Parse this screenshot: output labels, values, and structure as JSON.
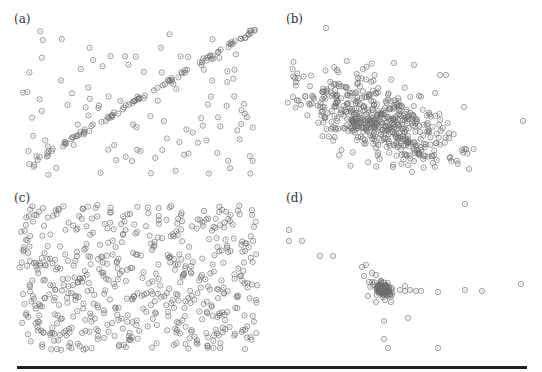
{
  "figure": {
    "marker": {
      "shape": "circle-with-dot",
      "radius": 2.6,
      "stroke": "#6e6e6e",
      "fill": "none",
      "dot": "#6e6e6e"
    },
    "rule_color": "#222222"
  },
  "panels": [
    {
      "label": "(a)",
      "label_pos": [
        14,
        12
      ]
    },
    {
      "label": "(b)",
      "label_pos": [
        286,
        12
      ]
    },
    {
      "label": "(c)",
      "label_pos": [
        14,
        191
      ]
    },
    {
      "label": "(d)",
      "label_pos": [
        286,
        191
      ]
    }
  ],
  "chart_data": [
    {
      "type": "scatter",
      "title": "(a)",
      "description": "Points on a straight diagonal line plus uniform random noise",
      "xlabel": "",
      "ylabel": "",
      "grid": false,
      "axes": false,
      "bbox": [
        17,
        28,
        255,
        175
      ],
      "line_component": {
        "x0": 17,
        "y0": 172,
        "x1": 255,
        "y1": 30,
        "n": 95,
        "jitter": 1.2
      },
      "noise_component": {
        "n": 110,
        "region": [
          17,
          28,
          255,
          175
        ]
      },
      "seed": 11
    },
    {
      "type": "scatter",
      "title": "(b)",
      "description": "Elongated Gaussian blob with negative tilt and a few outliers",
      "xlabel": "",
      "ylabel": "",
      "grid": false,
      "axes": false,
      "bbox": [
        286,
        25,
        525,
        172
      ],
      "cluster": {
        "cx": 372,
        "cy": 118,
        "sx": 42,
        "sy": 17,
        "angle_deg": 22,
        "n": 520
      },
      "outliers": [
        [
          326,
          28
        ],
        [
          394,
          63
        ],
        [
          414,
          65
        ],
        [
          440,
          75
        ],
        [
          446,
          75
        ],
        [
          464,
          107
        ],
        [
          523,
          121
        ],
        [
          462,
          150
        ],
        [
          358,
          78
        ],
        [
          337,
          70
        ]
      ],
      "seed": 23
    },
    {
      "type": "scatter",
      "title": "(c)",
      "description": "Uniformly scattered points filling the panel",
      "xlabel": "",
      "ylabel": "",
      "grid": false,
      "axes": false,
      "bbox": [
        19,
        205,
        258,
        350
      ],
      "uniform": {
        "n": 560
      },
      "seed": 37
    },
    {
      "type": "scatter",
      "title": "(d)",
      "description": "Very tight dense cluster with sparse outliers spread along axes",
      "xlabel": "",
      "ylabel": "",
      "grid": false,
      "axes": false,
      "bbox": [
        286,
        200,
        525,
        350
      ],
      "cluster": {
        "cx": 383,
        "cy": 290,
        "sx": 5,
        "sy": 3,
        "angle_deg": 30,
        "n": 120
      },
      "outliers": [
        [
          465,
          204
        ],
        [
          289,
          230
        ],
        [
          289,
          241
        ],
        [
          302,
          241
        ],
        [
          320,
          256
        ],
        [
          333,
          256
        ],
        [
          362,
          267
        ],
        [
          366,
          265
        ],
        [
          372,
          273
        ],
        [
          376,
          275
        ],
        [
          405,
          286
        ],
        [
          405,
          291
        ],
        [
          410,
          290
        ],
        [
          416,
          291
        ],
        [
          421,
          291
        ],
        [
          438,
          292
        ],
        [
          465,
          290
        ],
        [
          482,
          291
        ],
        [
          521,
          284
        ],
        [
          408,
          318
        ],
        [
          384,
          321
        ],
        [
          384,
          339
        ],
        [
          388,
          348
        ],
        [
          438,
          348
        ],
        [
          368,
          296
        ],
        [
          376,
          302
        ],
        [
          385,
          300
        ],
        [
          391,
          302
        ],
        [
          400,
          290
        ],
        [
          364,
          276
        ],
        [
          369,
          282
        ]
      ],
      "seed": 53
    }
  ]
}
